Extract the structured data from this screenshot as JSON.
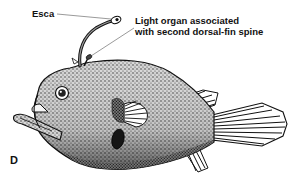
{
  "figure": {
    "panel_label": "D",
    "annotations": [
      {
        "id": "esca",
        "text": "Esca"
      },
      {
        "id": "light_organ",
        "lines": [
          "Light organ associated",
          "with second dorsal-fin spine"
        ]
      }
    ]
  },
  "colors": {
    "ink": "#111111",
    "background": "#ffffff"
  }
}
